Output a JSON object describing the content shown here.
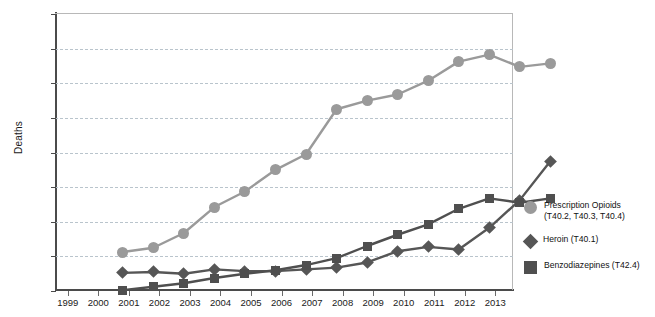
{
  "chart_data": {
    "type": "line",
    "title": "",
    "xlabel": "",
    "ylabel": "Deaths",
    "x": [
      1999,
      2000,
      2001,
      2002,
      2003,
      2004,
      2005,
      2006,
      2007,
      2008,
      2009,
      2010,
      2011,
      2012,
      2013
    ],
    "xtick_labels": [
      "1999",
      "2000",
      "2001",
      "2002",
      "2003",
      "2004",
      "2005",
      "2006",
      "2007",
      "2008",
      "2009",
      "2010",
      "2011",
      "2012",
      "2013"
    ],
    "ylim": [
      0,
      16000
    ],
    "ytick_values": [
      0,
      2000,
      4000,
      6000,
      8000,
      10000,
      12000,
      14000,
      16000
    ],
    "ytick_labels": [
      "0",
      "2,000",
      "4,000",
      "6,000",
      "8,000",
      "10,000",
      "12,000",
      "14,000",
      "16,000"
    ],
    "grid": true,
    "grid_style": "dashed-horizontal",
    "legend_position": "right",
    "series": [
      {
        "name": "Prescription Opioids (T40.2, T40.3, T40.4)",
        "marker": "circle",
        "color": "#9a9a9a",
        "values": [
          3000,
          3250,
          4100,
          5600,
          6500,
          7750,
          8650,
          11250,
          11750,
          12100,
          12900,
          14000,
          14400,
          13700,
          13900
        ]
      },
      {
        "name": "Heroin (T40.1)",
        "marker": "diamond",
        "color": "#565656",
        "values": [
          1800,
          1850,
          1750,
          2000,
          1900,
          1900,
          2000,
          2100,
          2400,
          3050,
          3300,
          3150,
          4400,
          6000,
          8250
        ]
      },
      {
        "name": "Benzodiazepines (T42.4)",
        "marker": "square",
        "color": "#4f4f4f",
        "values": [
          800,
          1000,
          1200,
          1500,
          1750,
          1950,
          2250,
          2650,
          3350,
          4000,
          4600,
          5500,
          6100,
          5850,
          6100
        ]
      }
    ]
  },
  "axes": {
    "y_title": "Deaths"
  },
  "legend": {
    "items": [
      {
        "label_line1": "Prescription Opioids",
        "label_line2": "(T40.2, T40.3, T40.4)",
        "marker": "circle-icon",
        "color": "#9a9a9a"
      },
      {
        "label_line1": "Heroin (T40.1)",
        "label_line2": "",
        "marker": "diamond-icon",
        "color": "#565656"
      },
      {
        "label_line1": "Benzodiazepines (T42.4)",
        "label_line2": "",
        "marker": "square-icon",
        "color": "#4f4f4f"
      }
    ]
  }
}
